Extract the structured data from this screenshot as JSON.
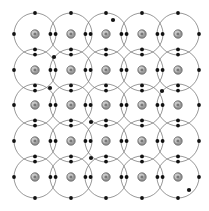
{
  "figure": {
    "title": "Covalent crystal lattice of atoms with shared valence electrons",
    "width": 209,
    "height": 211,
    "background_color": "#ffffff"
  },
  "colors": {
    "shell_stroke": "#6b6b6b",
    "nucleus_fill": "#9a9a9a",
    "nucleus_highlight": "#c9c9c9",
    "nucleus_core": "#777777",
    "nucleus_stroke": "#3a3a3a",
    "electron_fill": "#111111",
    "free_electron_fill": "#141414"
  },
  "lattice": {
    "rows": 5,
    "columns": 5,
    "atom_count": 25,
    "pitch_x": 35.7,
    "pitch_y": 35.7,
    "origin_x": 35,
    "origin_y": 34,
    "shell_radius": 21,
    "nucleus_radius": 4.2,
    "electron_radius": 1.9,
    "bond_pair_offset": 2.6
  },
  "atoms": [
    {
      "id": "atom-r1c1",
      "row": 1,
      "col": 1,
      "cx": 35,
      "cy": 34
    },
    {
      "id": "atom-r1c2",
      "row": 1,
      "col": 2,
      "cx": 71,
      "cy": 34
    },
    {
      "id": "atom-r1c3",
      "row": 1,
      "col": 3,
      "cx": 106,
      "cy": 34
    },
    {
      "id": "atom-r1c4",
      "row": 1,
      "col": 4,
      "cx": 142,
      "cy": 34
    },
    {
      "id": "atom-r1c5",
      "row": 1,
      "col": 5,
      "cx": 178,
      "cy": 34
    },
    {
      "id": "atom-r2c1",
      "row": 2,
      "col": 1,
      "cx": 35,
      "cy": 70
    },
    {
      "id": "atom-r2c2",
      "row": 2,
      "col": 2,
      "cx": 71,
      "cy": 70
    },
    {
      "id": "atom-r2c3",
      "row": 2,
      "col": 3,
      "cx": 106,
      "cy": 70
    },
    {
      "id": "atom-r2c4",
      "row": 2,
      "col": 4,
      "cx": 142,
      "cy": 70
    },
    {
      "id": "atom-r2c5",
      "row": 2,
      "col": 5,
      "cx": 178,
      "cy": 70
    },
    {
      "id": "atom-r3c1",
      "row": 3,
      "col": 1,
      "cx": 35,
      "cy": 105
    },
    {
      "id": "atom-r3c2",
      "row": 3,
      "col": 2,
      "cx": 71,
      "cy": 105
    },
    {
      "id": "atom-r3c3",
      "row": 3,
      "col": 3,
      "cx": 106,
      "cy": 105
    },
    {
      "id": "atom-r3c4",
      "row": 3,
      "col": 4,
      "cx": 142,
      "cy": 105
    },
    {
      "id": "atom-r3c5",
      "row": 3,
      "col": 5,
      "cx": 178,
      "cy": 105
    },
    {
      "id": "atom-r4c1",
      "row": 4,
      "col": 1,
      "cx": 35,
      "cy": 141
    },
    {
      "id": "atom-r4c2",
      "row": 4,
      "col": 2,
      "cx": 71,
      "cy": 141
    },
    {
      "id": "atom-r4c3",
      "row": 4,
      "col": 3,
      "cx": 106,
      "cy": 141
    },
    {
      "id": "atom-r4c4",
      "row": 4,
      "col": 4,
      "cx": 142,
      "cy": 141
    },
    {
      "id": "atom-r4c5",
      "row": 4,
      "col": 5,
      "cx": 178,
      "cy": 141
    },
    {
      "id": "atom-r5c1",
      "row": 5,
      "col": 1,
      "cx": 35,
      "cy": 177
    },
    {
      "id": "atom-r5c2",
      "row": 5,
      "col": 2,
      "cx": 71,
      "cy": 177
    },
    {
      "id": "atom-r5c3",
      "row": 5,
      "col": 3,
      "cx": 106,
      "cy": 177
    },
    {
      "id": "atom-r5c4",
      "row": 5,
      "col": 4,
      "cx": 142,
      "cy": 177
    },
    {
      "id": "atom-r5c5",
      "row": 5,
      "col": 5,
      "cx": 178,
      "cy": 177
    }
  ],
  "bond_pairs_horizontal": [
    {
      "id": "bond-h-r1-c1c2",
      "cx": 53,
      "cy": 34
    },
    {
      "id": "bond-h-r1-c2c3",
      "cx": 88,
      "cy": 34
    },
    {
      "id": "bond-h-r1-c3c4",
      "cx": 124,
      "cy": 34
    },
    {
      "id": "bond-h-r1-c4c5",
      "cx": 160,
      "cy": 34
    },
    {
      "id": "bond-h-r2-c1c2",
      "cx": 53,
      "cy": 70
    },
    {
      "id": "bond-h-r2-c2c3",
      "cx": 88,
      "cy": 70
    },
    {
      "id": "bond-h-r2-c3c4",
      "cx": 124,
      "cy": 70
    },
    {
      "id": "bond-h-r2-c4c5",
      "cx": 160,
      "cy": 70
    },
    {
      "id": "bond-h-r3-c1c2",
      "cx": 53,
      "cy": 105
    },
    {
      "id": "bond-h-r3-c2c3",
      "cx": 88,
      "cy": 105
    },
    {
      "id": "bond-h-r3-c3c4",
      "cx": 124,
      "cy": 105
    },
    {
      "id": "bond-h-r3-c4c5",
      "cx": 160,
      "cy": 105
    },
    {
      "id": "bond-h-r4-c1c2",
      "cx": 53,
      "cy": 141
    },
    {
      "id": "bond-h-r4-c2c3",
      "cx": 88,
      "cy": 141
    },
    {
      "id": "bond-h-r4-c3c4",
      "cx": 124,
      "cy": 141
    },
    {
      "id": "bond-h-r4-c4c5",
      "cx": 160,
      "cy": 141
    },
    {
      "id": "bond-h-r5-c1c2",
      "cx": 53,
      "cy": 177
    },
    {
      "id": "bond-h-r5-c2c3",
      "cx": 88,
      "cy": 177
    },
    {
      "id": "bond-h-r5-c3c4",
      "cx": 124,
      "cy": 177
    },
    {
      "id": "bond-h-r5-c4c5",
      "cx": 160,
      "cy": 177
    }
  ],
  "bond_pairs_vertical": [
    {
      "id": "bond-v-c1-r1r2",
      "cx": 35,
      "cy": 52
    },
    {
      "id": "bond-v-c2-r1r2",
      "cx": 71,
      "cy": 52
    },
    {
      "id": "bond-v-c3-r1r2",
      "cx": 106,
      "cy": 52
    },
    {
      "id": "bond-v-c4-r1r2",
      "cx": 142,
      "cy": 52
    },
    {
      "id": "bond-v-c5-r1r2",
      "cx": 178,
      "cy": 52
    },
    {
      "id": "bond-v-c1-r2r3",
      "cx": 35,
      "cy": 88
    },
    {
      "id": "bond-v-c2-r2r3",
      "cx": 71,
      "cy": 88
    },
    {
      "id": "bond-v-c3-r2r3",
      "cx": 106,
      "cy": 88
    },
    {
      "id": "bond-v-c4-r2r3",
      "cx": 142,
      "cy": 88
    },
    {
      "id": "bond-v-c5-r2r3",
      "cx": 178,
      "cy": 88
    },
    {
      "id": "bond-v-c1-r3r4",
      "cx": 35,
      "cy": 123
    },
    {
      "id": "bond-v-c2-r3r4",
      "cx": 71,
      "cy": 123
    },
    {
      "id": "bond-v-c3-r3r4",
      "cx": 106,
      "cy": 123
    },
    {
      "id": "bond-v-c4-r3r4",
      "cx": 142,
      "cy": 123
    },
    {
      "id": "bond-v-c5-r3r4",
      "cx": 178,
      "cy": 123
    },
    {
      "id": "bond-v-c1-r4r5",
      "cx": 35,
      "cy": 159
    },
    {
      "id": "bond-v-c2-r4r5",
      "cx": 71,
      "cy": 159
    },
    {
      "id": "bond-v-c3-r4r5",
      "cx": 106,
      "cy": 159
    },
    {
      "id": "bond-v-c4-r4r5",
      "cx": 142,
      "cy": 159
    },
    {
      "id": "bond-v-c5-r4r5",
      "cx": 178,
      "cy": 159
    }
  ],
  "edge_electrons": [
    {
      "id": "edge-top-c1",
      "cx": 35,
      "cy": 13
    },
    {
      "id": "edge-top-c2",
      "cx": 71,
      "cy": 13
    },
    {
      "id": "edge-top-c3",
      "cx": 106,
      "cy": 13
    },
    {
      "id": "edge-top-c4",
      "cx": 142,
      "cy": 13
    },
    {
      "id": "edge-top-c5",
      "cx": 178,
      "cy": 13
    },
    {
      "id": "edge-bottom-c1",
      "cx": 35,
      "cy": 198
    },
    {
      "id": "edge-bottom-c2",
      "cx": 71,
      "cy": 198
    },
    {
      "id": "edge-bottom-c3",
      "cx": 106,
      "cy": 198
    },
    {
      "id": "edge-bottom-c4",
      "cx": 142,
      "cy": 198
    },
    {
      "id": "edge-bottom-c5",
      "cx": 178,
      "cy": 198
    },
    {
      "id": "edge-left-r1",
      "cx": 14,
      "cy": 34
    },
    {
      "id": "edge-left-r2",
      "cx": 14,
      "cy": 70
    },
    {
      "id": "edge-left-r3",
      "cx": 14,
      "cy": 105
    },
    {
      "id": "edge-left-r4",
      "cx": 14,
      "cy": 141
    },
    {
      "id": "edge-left-r5",
      "cx": 14,
      "cy": 177
    },
    {
      "id": "edge-right-r1",
      "cx": 199,
      "cy": 34
    },
    {
      "id": "edge-right-r2",
      "cx": 199,
      "cy": 70
    },
    {
      "id": "edge-right-r3",
      "cx": 199,
      "cy": 105
    },
    {
      "id": "edge-right-r4",
      "cx": 199,
      "cy": 141
    },
    {
      "id": "edge-right-r5",
      "cx": 199,
      "cy": 177
    }
  ],
  "free_electrons": [
    {
      "id": "free-electron-1",
      "cx": 113,
      "cy": 20
    },
    {
      "id": "free-electron-2",
      "cx": 54,
      "cy": 57
    },
    {
      "id": "free-electron-3",
      "cx": 50,
      "cy": 88
    },
    {
      "id": "free-electron-4",
      "cx": 162,
      "cy": 91
    },
    {
      "id": "free-electron-5",
      "cx": 91,
      "cy": 122
    },
    {
      "id": "free-electron-6",
      "cx": 91,
      "cy": 158
    },
    {
      "id": "free-electron-7",
      "cx": 189,
      "cy": 190
    }
  ]
}
